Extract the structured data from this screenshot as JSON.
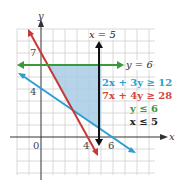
{
  "graph": {
    "axes": {
      "x_label": "x",
      "y_label": "y"
    },
    "tick_labels": {
      "origin": "0",
      "x4": "4",
      "x6": "6",
      "y4": "4",
      "y7": "7"
    },
    "line_labels": {
      "x_eq_5": "x = 5",
      "y_eq_6": "y = 6"
    },
    "legend": [
      {
        "text": "2x + 3y ≥ 12",
        "color": "#2a9fd0"
      },
      {
        "text": "7x + 4y ≥ 28",
        "color": "#d2473a"
      },
      {
        "text": "y ≤ 6",
        "color": "#3a9a3a"
      },
      {
        "text": "x ≤ 5",
        "color": "#222222"
      }
    ],
    "colors": {
      "shade": "#a8cde6",
      "blue_line": "#2a9fd0",
      "red_line": "#c8383a",
      "green_line": "#3a9a3a",
      "black_line": "#111111",
      "grid": "#c8c8c8"
    }
  }
}
